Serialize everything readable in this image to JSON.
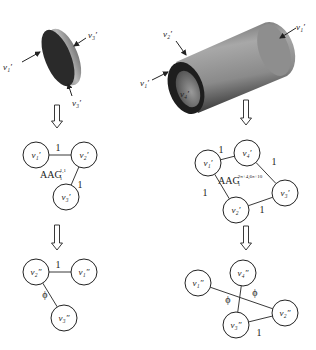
{
  "figure": {
    "left": {
      "shape": "disk",
      "shape_labels": [
        {
          "id": "disk-label-v1",
          "text": "v₁′",
          "x": 3,
          "y": 70,
          "arrow": [
            22,
            62,
            40,
            52
          ]
        },
        {
          "id": "disk-label-v3-top",
          "text": "v₃′",
          "x": 88,
          "y": 38,
          "arrow": [
            86,
            38,
            74,
            46
          ]
        },
        {
          "id": "disk-label-v3-bottom",
          "text": "v₃′",
          "x": 72,
          "y": 106,
          "arrow": [
            72,
            96,
            68,
            84
          ]
        }
      ],
      "graph1": {
        "title": "AAG",
        "subscript": "1",
        "superscript": "1,1",
        "title_pos": [
          40,
          178
        ],
        "nodes": [
          {
            "id": "v1",
            "label": "v₁′",
            "x": 36,
            "y": 155
          },
          {
            "id": "v2",
            "label": "v₂′",
            "x": 84,
            "y": 155
          },
          {
            "id": "v3",
            "label": "v₃′",
            "x": 66,
            "y": 197
          }
        ],
        "edges": [
          {
            "from": "v1",
            "to": "v2",
            "label": "1",
            "lx": 58,
            "ly": 151
          },
          {
            "from": "v2",
            "to": "v3",
            "label": "1",
            "lx": 80,
            "ly": 188
          }
        ]
      },
      "graph2": {
        "nodes": [
          {
            "id": "v2",
            "label": "v₂″",
            "x": 36,
            "y": 272
          },
          {
            "id": "v1",
            "label": "v₁″",
            "x": 84,
            "y": 272
          },
          {
            "id": "v3",
            "label": "v₃″",
            "x": 64,
            "y": 318
          }
        ],
        "edges": [
          {
            "from": "v2",
            "to": "v1",
            "label": "1",
            "lx": 58,
            "ly": 268
          },
          {
            "from": "v2",
            "to": "v3",
            "label": "ϕ",
            "lx": 45,
            "ly": 298
          }
        ]
      },
      "arrows": [
        {
          "x": 57,
          "y1": 105,
          "y2": 128
        },
        {
          "x": 57,
          "y1": 225,
          "y2": 250
        }
      ]
    },
    "right": {
      "shape": "hollow-cylinder",
      "shape_labels": [
        {
          "id": "cyl-label-v1-right",
          "text": "v₁′",
          "x": 296,
          "y": 30,
          "arrow": [
            296,
            28,
            280,
            38
          ]
        },
        {
          "id": "cyl-label-v2",
          "text": "v₂′",
          "x": 163,
          "y": 37,
          "arrow": [
            176,
            41,
            186,
            55
          ]
        },
        {
          "id": "cyl-label-v1-left",
          "text": "v₁′",
          "x": 140,
          "y": 86,
          "arrow": [
            152,
            80,
            168,
            72
          ]
        },
        {
          "id": "cyl-label-v4",
          "text": "v₄′",
          "x": 180,
          "y": 97,
          "arrow": null
        }
      ],
      "graph1": {
        "title": "AAG",
        "subscript": "1",
        "superscript": "2π+4,6π+10",
        "title_pos": [
          218,
          184
        ],
        "nodes": [
          {
            "id": "v1",
            "label": "v₁′",
            "x": 208,
            "y": 163
          },
          {
            "id": "v4",
            "label": "v₄′",
            "x": 247,
            "y": 153
          },
          {
            "id": "v3",
            "label": "v₃′",
            "x": 285,
            "y": 193
          },
          {
            "id": "v2",
            "label": "v₂′",
            "x": 236,
            "y": 210
          }
        ],
        "edges": [
          {
            "from": "v1",
            "to": "v4",
            "label": "1",
            "lx": 221,
            "ly": 153
          },
          {
            "from": "v4",
            "to": "v3",
            "label": "1",
            "lx": 274,
            "ly": 165
          },
          {
            "from": "v1",
            "to": "v2",
            "label": "1",
            "lx": 205,
            "ly": 196
          },
          {
            "from": "v2",
            "to": "v3",
            "label": "1",
            "lx": 262,
            "ly": 213
          }
        ]
      },
      "graph2": {
        "nodes": [
          {
            "id": "v1",
            "label": "v₁″",
            "x": 198,
            "y": 283
          },
          {
            "id": "v4",
            "label": "v₄″",
            "x": 243,
            "y": 273
          },
          {
            "id": "v2",
            "label": "v₂″",
            "x": 285,
            "y": 313
          },
          {
            "id": "v3",
            "label": "v₃″",
            "x": 236,
            "y": 325
          }
        ],
        "edges": [
          {
            "from": "v1",
            "to": "v2",
            "label": "ϕ",
            "lx": 255,
            "ly": 296
          },
          {
            "from": "v4",
            "to": "v3",
            "label": "ϕ",
            "lx": 228,
            "ly": 303
          },
          {
            "from": "v3",
            "to": "v2",
            "label": "1",
            "lx": 259,
            "ly": 336
          }
        ]
      },
      "arrows": [
        {
          "x": 246,
          "y1": 100,
          "y2": 125
        },
        {
          "x": 246,
          "y1": 226,
          "y2": 250
        }
      ]
    }
  },
  "style": {
    "stroke": "#222222",
    "disk_face": "#2a2a2a",
    "disk_rim": "#9a9a9a",
    "cyl_body": "#8a8a8a",
    "cyl_end": "#1e1e1e"
  }
}
